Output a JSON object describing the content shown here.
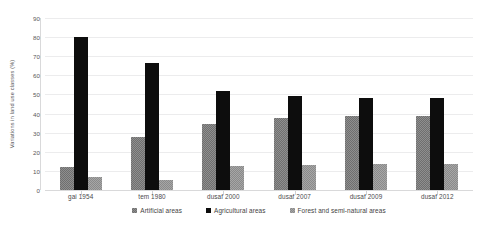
{
  "chart_data": {
    "type": "bar",
    "title": "",
    "xlabel": "",
    "ylabel": "Variations in land use classes (%)",
    "categories": [
      "gai 1954",
      "tem 1980",
      "dusaf 2000",
      "dusaf 2007",
      "dusaf 2009",
      "dusaf 2012"
    ],
    "series": [
      {
        "name": "Artificial areas",
        "values": [
          12,
          28,
          34.5,
          37.5,
          38.5,
          38.5
        ]
      },
      {
        "name": "Agricultural areas",
        "values": [
          80,
          66.5,
          52,
          49,
          48,
          48
        ]
      },
      {
        "name": "Forest and semi-natural areas",
        "values": [
          7,
          5.5,
          12.5,
          13,
          13.5,
          13.5
        ]
      }
    ],
    "ylim": [
      0,
      90
    ],
    "yticks": [
      0,
      10,
      20,
      30,
      40,
      50,
      60,
      70,
      80,
      90
    ],
    "grid": true,
    "legend_position": "bottom",
    "colors": {
      "artificial": "#8f8f8f",
      "agricultural": "#0d0d0d",
      "forest": "#a6a6a6",
      "gridline": "#ececed",
      "axis": "#d9d9da",
      "text": "#4a4a4c",
      "background": "#ffffff"
    }
  }
}
